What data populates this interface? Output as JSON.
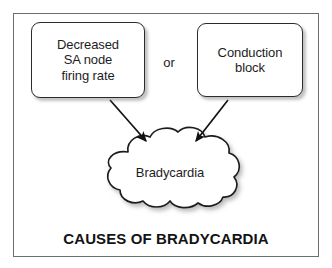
{
  "figure": {
    "caption": "CAUSES OF BRADYCARDIA",
    "connector_label": "or",
    "outcome_label": "Bradycardia",
    "causes": [
      {
        "label": "Decreased\nSA node\nfiring rate"
      },
      {
        "label": "Conduction\nblock"
      }
    ],
    "colors": {
      "frame_border": "#6b6e72",
      "node_border": "#2b2b2b",
      "node_fill": "#ffffff",
      "text": "#1d1d1d",
      "caption_text": "#131313",
      "arrow": "#111111",
      "shadow": "#78787d",
      "background": "#ffffff"
    }
  }
}
